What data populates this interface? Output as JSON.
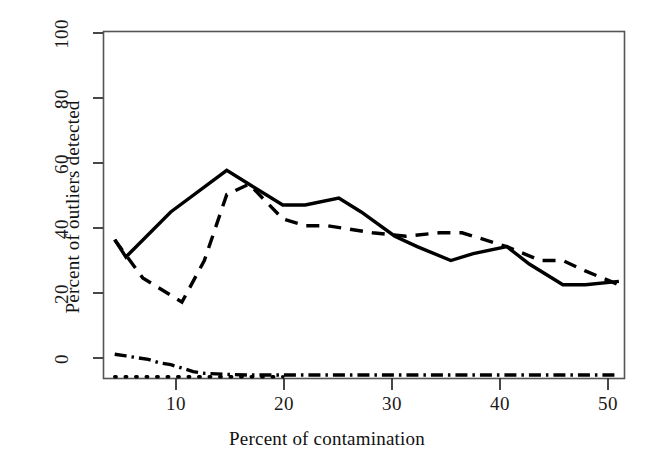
{
  "chart_data": {
    "type": "line",
    "title": "",
    "xlabel": "Percent of contamination",
    "ylabel": "Percent of outliers detected",
    "xlim": [
      4,
      50.5
    ],
    "ylim": [
      0,
      100
    ],
    "xticks": [
      10,
      20,
      30,
      40,
      50
    ],
    "yticks": [
      0,
      20,
      40,
      60,
      80,
      100
    ],
    "grid": false,
    "legend": "none",
    "frame": "box",
    "series": [
      {
        "name": "solid-line",
        "style": "solid",
        "x": [
          5,
          6,
          10,
          15,
          17,
          20,
          22,
          25,
          27,
          30,
          32,
          35,
          37,
          40,
          42,
          45,
          47,
          50
        ],
        "y": [
          40,
          35,
          48,
          60,
          56,
          50,
          50,
          52,
          48,
          41,
          38,
          34,
          36,
          38,
          33,
          27,
          27,
          28
        ]
      },
      {
        "name": "dashed-line",
        "style": "dashed",
        "x": [
          5,
          7.5,
          10,
          11,
          13,
          15,
          17,
          20,
          22,
          24,
          26,
          28,
          31,
          34,
          36,
          40,
          43,
          45,
          47,
          50
        ],
        "y": [
          40,
          29,
          24,
          22,
          34,
          53,
          56,
          46,
          44,
          44,
          43,
          42,
          41,
          42,
          42,
          38,
          34,
          34,
          31,
          27
        ]
      },
      {
        "name": "dash-dot-line",
        "style": "dashdot",
        "x": [
          5,
          6,
          8,
          9,
          10,
          11,
          12,
          13,
          15,
          17,
          20,
          25,
          30,
          35,
          40,
          45,
          50
        ],
        "y": [
          7,
          6.5,
          5.5,
          4.5,
          4,
          3,
          2,
          1.5,
          1.2,
          1,
          1,
          1,
          1,
          1,
          1,
          1,
          1
        ]
      },
      {
        "name": "dotted-line",
        "style": "dotted",
        "x": [
          5,
          6,
          7,
          8,
          9,
          10,
          11,
          12,
          13,
          14,
          15,
          16,
          17,
          18,
          19,
          20
        ],
        "y": [
          0.5,
          0.5,
          0.5,
          0.5,
          0.5,
          0.5,
          0.5,
          0.5,
          0.5,
          0.5,
          0.5,
          0.5,
          0.5,
          0.5,
          0.5,
          0.5
        ]
      }
    ]
  },
  "axes": {
    "xlabel": "Percent of contamination",
    "ylabel": "Percent of outliers detected",
    "xticks": [
      "10",
      "20",
      "30",
      "40",
      "50"
    ],
    "yticks": [
      "0",
      "20",
      "40",
      "60",
      "80",
      "100"
    ]
  },
  "colors": {
    "line": "#000000",
    "frame": "#4d4d4d",
    "background": "#ffffff",
    "text": "#111111"
  }
}
